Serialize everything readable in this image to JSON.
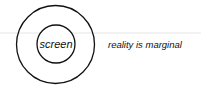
{
  "diagram": {
    "inner_label": "screen",
    "outer_label": "reality is marginal",
    "colors": {
      "stroke": "#111111",
      "divider": "#e6e6e6",
      "background": "#ffffff"
    }
  }
}
